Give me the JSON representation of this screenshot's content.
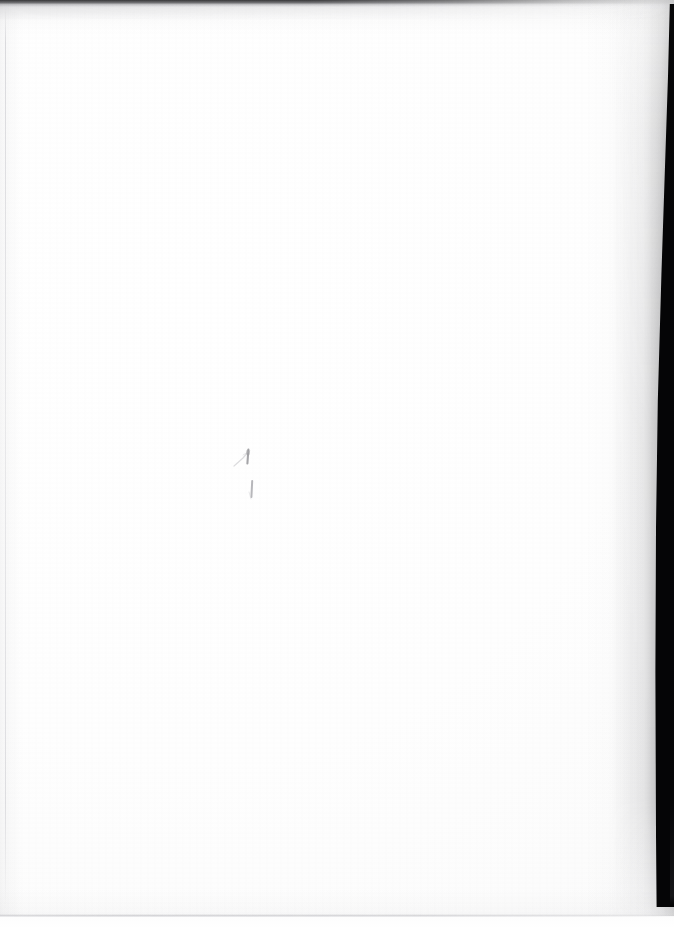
{
  "page": {
    "kind": "scanned-document-page",
    "content_state": "blank",
    "body_text": "",
    "width_px": 674,
    "height_px": 929,
    "paper_color": "#fdfdfd",
    "background_color": "#ffffff"
  },
  "edges": {
    "top_band": {
      "name": "top-edge-shadow",
      "color": "#262628",
      "thickness_px": 7,
      "fades_toward": "right"
    },
    "right_band": {
      "name": "right-edge-black-wedge",
      "color": "#050506",
      "starts_y_px": 4,
      "ends_y_px": 907,
      "width_top_px": 6,
      "width_bottom_px": 19
    },
    "bottom_band": {
      "name": "bottom-edge-shadow",
      "color": "#a8a8ae",
      "thickness_px": 3,
      "offset_from_bottom_px": 12
    },
    "left_rule": {
      "name": "left-edge-rule",
      "color": "#afafb6",
      "x_px": 5,
      "thickness_px": 1
    }
  },
  "marks": [
    {
      "id": "mark-tick",
      "label": "pencil-tick-mark",
      "x_px": 240,
      "y_px": 456,
      "width_px": 16,
      "height_px": 16,
      "color": "#8a8a8f"
    },
    {
      "id": "mark-stroke",
      "label": "pencil-vertical-stroke",
      "x_px": 250,
      "y_px": 482,
      "width_px": 5,
      "height_px": 17,
      "color": "#9a9aa0"
    }
  ]
}
